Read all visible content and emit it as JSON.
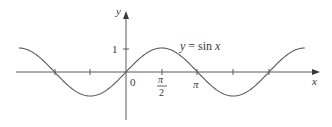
{
  "chart_data": {
    "type": "line",
    "title": "",
    "function_label": "y = sin x",
    "xlabel": "x",
    "ylabel": "y",
    "x_range": [
      -4.8,
      8.0
    ],
    "y_range": [
      -1.25,
      1.25
    ],
    "grid": false,
    "legend": "none (inline label near curve)",
    "x_ticks": [
      {
        "value": -3.14159,
        "label": ""
      },
      {
        "value": -1.5708,
        "label": ""
      },
      {
        "value": 0,
        "label": "0"
      },
      {
        "value": 1.5708,
        "label": "π/2"
      },
      {
        "value": 3.14159,
        "label": "π"
      },
      {
        "value": 4.7124,
        "label": ""
      },
      {
        "value": 6.28319,
        "label": ""
      }
    ],
    "y_ticks": [
      {
        "value": 1,
        "label": "1"
      }
    ],
    "series": [
      {
        "name": "y = sin x",
        "x": [
          -4.7124,
          -3.14159,
          -1.5708,
          0,
          1.5708,
          3.14159,
          4.7124,
          6.28319,
          7.854
        ],
        "values": [
          1,
          0,
          -1,
          0,
          1,
          0,
          -1,
          0,
          1
        ]
      }
    ]
  },
  "labels": {
    "y_axis": "y",
    "x_axis": "x",
    "origin": "0",
    "one": "1",
    "pi": "π",
    "pi_half_num": "π",
    "pi_half_den": "2",
    "func_y": "y",
    "func_eq": " = sin ",
    "func_x": "x"
  },
  "colors": {
    "curve": "#5a5a5a",
    "axes": "#5a5a5a",
    "text": "#3a3a3a"
  }
}
